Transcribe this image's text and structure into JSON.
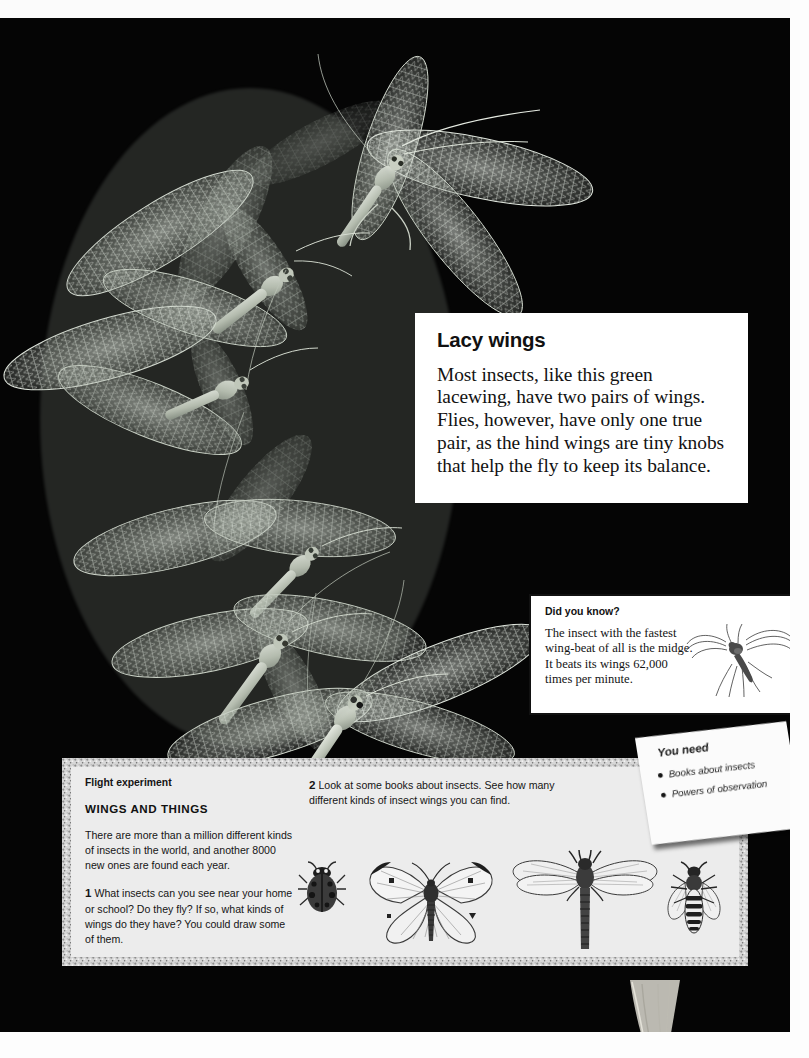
{
  "page": {
    "background_color": "#050505",
    "paper_color": "#ffffff"
  },
  "photo": {
    "subject": "green lacewings in flight",
    "alt": "Several green lacewings with lacy transparent wings arranged diagonally on a black background"
  },
  "lacy_wings": {
    "title": "Lacy wings",
    "body": "Most insects, like this green lacewing, have two pairs of wings. Flies, however, have only one true pair, as the hind wings are tiny knobs that help the fly to keep its balance."
  },
  "did_you_know": {
    "title": "Did you know?",
    "body": "The insect with the fastest wing-beat of all is the midge. It beats its wings 62,000 times per minute.",
    "illustration": "midge-illustration"
  },
  "flight_experiment": {
    "kicker": "Flight experiment",
    "heading": "WINGS AND THINGS",
    "intro": "There are more than a million different kinds of insects in the world, and another 8000 new ones are found each year.",
    "steps": [
      {
        "number": "1",
        "text": "What insects can you see near your home or school? Do they fly? If so, what kinds of wings do they have? You could draw some of them."
      },
      {
        "number": "2",
        "text": "Look at some books about insects. See how many different kinds of insect wings you can find."
      }
    ],
    "illustrations": [
      "ladybird-illustration",
      "butterfly-illustration",
      "dragonfly-illustration",
      "wasp-illustration"
    ]
  },
  "you_need": {
    "title": "You need",
    "items": [
      "Books about insects",
      "Powers of observation"
    ],
    "bullet": "●"
  },
  "colors": {
    "background": "#050505",
    "panel": "#ececec",
    "panel_frame": "#c9c9c9",
    "text": "#111111"
  }
}
